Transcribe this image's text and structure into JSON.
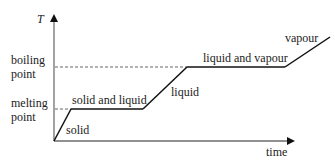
{
  "diagram": {
    "y_axis_label": "T",
    "x_axis_label": "time",
    "y_markers": [
      {
        "id": "boiling",
        "label_line1": "boiling",
        "label_line2": "point"
      },
      {
        "id": "melting",
        "label_line1": "melting",
        "label_line2": "point"
      }
    ],
    "segments": [
      {
        "label": "solid",
        "kind": "rise"
      },
      {
        "label": "solid and liquid",
        "kind": "plateau"
      },
      {
        "label": "liquid",
        "kind": "rise"
      },
      {
        "label": "liquid and vapour",
        "kind": "plateau"
      },
      {
        "label": "vapour",
        "kind": "rise"
      }
    ],
    "colors": {
      "line": "#111111",
      "axis": "#555555",
      "dashed": "#666666",
      "text": "#222222"
    }
  }
}
